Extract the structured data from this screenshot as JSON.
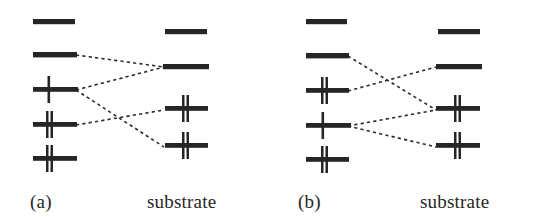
{
  "figure": {
    "background_color": "#ffffff",
    "ink_color": "#262626",
    "type": "energy-level-correlation-diagram",
    "panel_count": 2
  },
  "panels": [
    {
      "id": "a",
      "caption_index": "(a)",
      "caption_substrate": "substrate",
      "left_column": {
        "name": "molecule-levels",
        "x_start": 33,
        "x_end": 75,
        "levels": [
          {
            "label": "level-a-left-1",
            "y": 22,
            "electrons": 0,
            "occupancy": "empty"
          },
          {
            "label": "level-a-left-2",
            "y": 55,
            "electrons": 0,
            "occupancy": "empty"
          },
          {
            "label": "level-a-left-3",
            "y": 89,
            "electrons": 1,
            "occupancy": "singly-occupied"
          },
          {
            "label": "level-a-left-4",
            "y": 124,
            "electrons": 2,
            "occupancy": "doubly-occupied"
          },
          {
            "label": "level-a-left-5",
            "y": 158,
            "electrons": 2,
            "occupancy": "doubly-occupied"
          }
        ]
      },
      "right_column": {
        "name": "substrate-levels",
        "x_start": 165,
        "x_end": 207,
        "levels": [
          {
            "label": "level-a-right-1",
            "y": 32,
            "electrons": 0,
            "occupancy": "empty"
          },
          {
            "label": "level-a-right-2",
            "y": 66,
            "electrons": 0,
            "occupancy": "empty"
          },
          {
            "label": "level-a-right-3",
            "y": 108,
            "electrons": 2,
            "occupancy": "doubly-occupied"
          },
          {
            "label": "level-a-right-4",
            "y": 145,
            "electrons": 2,
            "occupancy": "doubly-occupied"
          }
        ]
      },
      "correlation_lines": [
        {
          "name": "link-a-1",
          "from_level": 2,
          "to_level": 3
        },
        {
          "name": "link-a-2",
          "from_level": 3,
          "to_level": 2
        },
        {
          "name": "link-a-3",
          "from_level": 3,
          "to_level": 4
        },
        {
          "name": "link-a-4",
          "from_level": 4,
          "to_level": 2
        }
      ]
    },
    {
      "id": "b",
      "caption_index": "(b)",
      "caption_substrate": "substrate",
      "left_column": {
        "name": "molecule-levels",
        "x_start": 33,
        "x_end": 75,
        "levels": [
          {
            "label": "level-b-left-1",
            "y": 22,
            "electrons": 0,
            "occupancy": "empty"
          },
          {
            "label": "level-b-left-2",
            "y": 55,
            "electrons": 0,
            "occupancy": "empty"
          },
          {
            "label": "level-b-left-3",
            "y": 89,
            "electrons": 2,
            "occupancy": "doubly-occupied"
          },
          {
            "label": "level-b-left-4",
            "y": 124,
            "electrons": 1,
            "occupancy": "singly-occupied"
          },
          {
            "label": "level-b-left-5",
            "y": 158,
            "electrons": 2,
            "occupancy": "doubly-occupied"
          }
        ]
      },
      "right_column": {
        "name": "substrate-levels",
        "x_start": 165,
        "x_end": 207,
        "levels": [
          {
            "label": "level-b-right-1",
            "y": 32,
            "electrons": 0,
            "occupancy": "empty"
          },
          {
            "label": "level-b-right-2",
            "y": 66,
            "electrons": 0,
            "occupancy": "empty"
          },
          {
            "label": "level-b-right-3",
            "y": 108,
            "electrons": 2,
            "occupancy": "doubly-occupied"
          },
          {
            "label": "level-b-right-4",
            "y": 145,
            "electrons": 2,
            "occupancy": "doubly-occupied"
          }
        ]
      },
      "correlation_lines": [
        {
          "name": "link-b-1",
          "from_level": 2,
          "to_level": 3
        },
        {
          "name": "link-b-2",
          "from_level": 3,
          "to_level": 2
        },
        {
          "name": "link-b-3",
          "from_level": 4,
          "to_level": 3
        },
        {
          "name": "link-b-4",
          "from_level": 4,
          "to_level": 4
        }
      ]
    }
  ]
}
